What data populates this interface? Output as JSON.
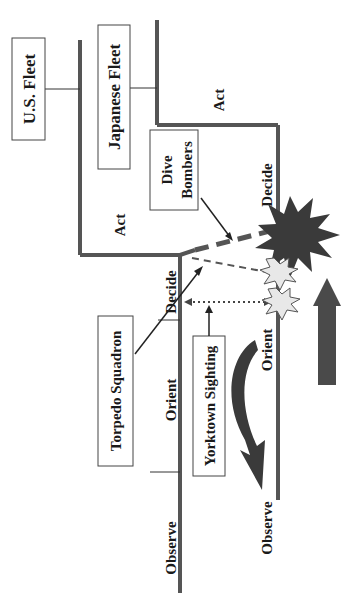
{
  "diagram": {
    "type": "ooda-loop-comparison",
    "orientation": "rotated-90-ccw",
    "fleets": [
      {
        "id": "us",
        "label": "U.S. Fleet"
      },
      {
        "id": "japanese",
        "label": "Japanese Fleet"
      }
    ],
    "us_phases": {
      "observe": "Observe",
      "orient": "Orient",
      "decide": "Decide",
      "act": "Act"
    },
    "japanese_phases": {
      "observe": "Observe",
      "orient": "Orient",
      "decide": "Decide",
      "act": "Act"
    },
    "callouts": {
      "dive_bombers": [
        "Dive",
        "Bombers"
      ],
      "torpedo_squadron": "Torpedo Squadron",
      "yorktown_sighting": "Yorktown Sighting"
    },
    "colors": {
      "line": "#555555",
      "explosion_large": "#3a3a3a",
      "explosion_small": "#e8e8e8",
      "arrow": "#4a4a4a"
    }
  }
}
